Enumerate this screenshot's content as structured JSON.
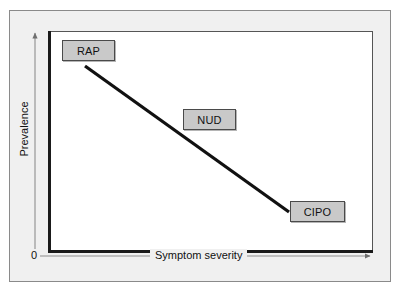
{
  "figure": {
    "type": "conceptual-diagram"
  },
  "axes": {
    "y_label": "Prevalence",
    "x_label": "Symptom severity",
    "origin_label": "0",
    "y_direction": "increasing upward",
    "x_direction": "increasing rightward"
  },
  "nodes": [
    {
      "id": "rap",
      "label": "RAP",
      "position": "upper-left"
    },
    {
      "id": "nud",
      "label": "NUD",
      "position": "middle"
    },
    {
      "id": "cipo",
      "label": "CIPO",
      "position": "lower-right"
    }
  ],
  "trend_line": {
    "style": "solid",
    "direction": "descending",
    "from": "RAP (high prevalence, low severity)",
    "to": "CIPO (low prevalence, high severity)"
  },
  "colors": {
    "page_background": "#ffffff",
    "panel_background": "#f0f0f0",
    "panel_border": "#8a8a8a",
    "plot_background": "#ffffff",
    "plot_axis": "#1a1a1a",
    "box_fill": "#c9c9c9",
    "box_border": "#4a4a4a",
    "trend_line": "#111111",
    "thin_axis_arrow": "#8e8e8e",
    "text": "#111111"
  }
}
